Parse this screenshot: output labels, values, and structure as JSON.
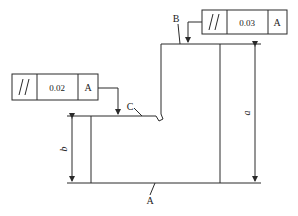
{
  "diagram": {
    "type": "engineering-drawing",
    "labels": {
      "datum": "A",
      "surface_top": "B",
      "surface_step": "C",
      "dim_height_total": "a",
      "dim_height_step": "b"
    },
    "frames": [
      {
        "symbol": "//",
        "tolerance": "0.03",
        "datum": "A",
        "applies_to": "B"
      },
      {
        "symbol": "//",
        "tolerance": "0.02",
        "datum": "A",
        "applies_to": "C"
      }
    ],
    "colors": {
      "line": "#2a2a2a",
      "background": "#ffffff"
    }
  }
}
